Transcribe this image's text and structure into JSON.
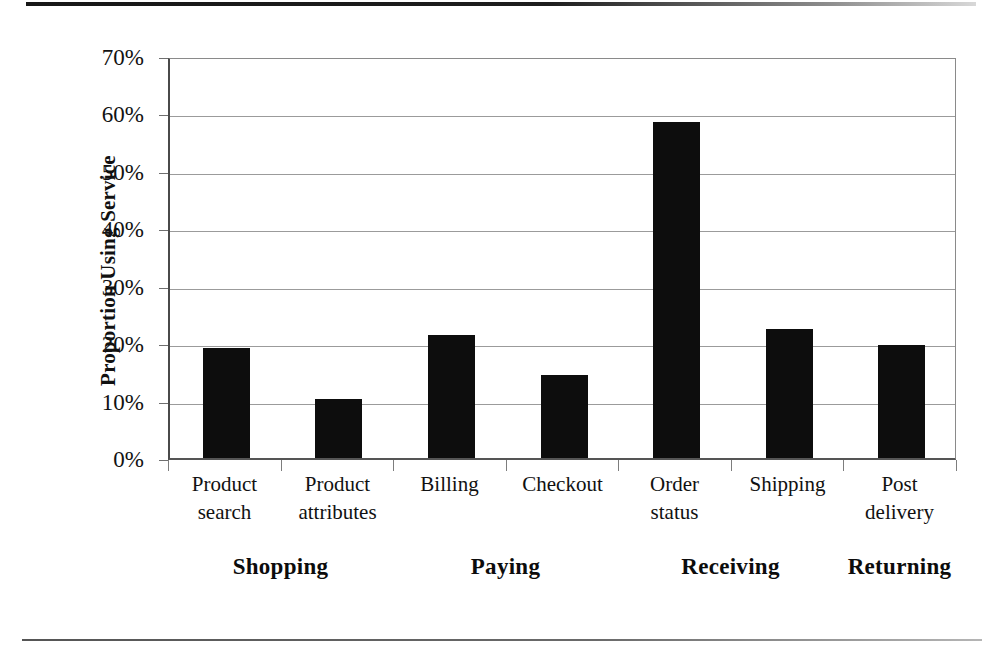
{
  "chart_data": {
    "type": "bar",
    "title": "",
    "subtitle": "",
    "xlabel": "",
    "ylabel": "Proportion Using Service",
    "categories": [
      "Product search",
      "Product attributes",
      "Billing",
      "Checkout",
      "Order status",
      "Shipping",
      "Post delivery"
    ],
    "category_lines": [
      [
        "Product",
        "search"
      ],
      [
        "Product",
        "attributes"
      ],
      [
        "Billing",
        ""
      ],
      [
        "Checkout",
        ""
      ],
      [
        "Order",
        "status"
      ],
      [
        "Shipping",
        ""
      ],
      [
        "Post",
        "delivery"
      ]
    ],
    "values": [
      19.2,
      10.3,
      21.4,
      14.4,
      58.5,
      22.5,
      19.6
    ],
    "value_unit": "%",
    "ylim": [
      0,
      70
    ],
    "ytick_values": [
      0,
      10,
      20,
      30,
      40,
      50,
      60,
      70
    ],
    "ytick_labels": [
      "0%",
      "10%",
      "20%",
      "30%",
      "40%",
      "50%",
      "60%",
      "70%"
    ],
    "grid": true,
    "legend": "none",
    "bar_color": "#0d0d0d",
    "groups": [
      {
        "label": "Shopping",
        "categories": [
          "Product search",
          "Product attributes"
        ]
      },
      {
        "label": "Paying",
        "categories": [
          "Billing",
          "Checkout"
        ]
      },
      {
        "label": "Receiving",
        "categories": [
          "Order status",
          "Shipping"
        ]
      },
      {
        "label": "Returning",
        "categories": [
          "Post delivery"
        ]
      }
    ],
    "group_labels": [
      "Shopping",
      "Paying",
      "Receiving",
      "Returning"
    ]
  }
}
